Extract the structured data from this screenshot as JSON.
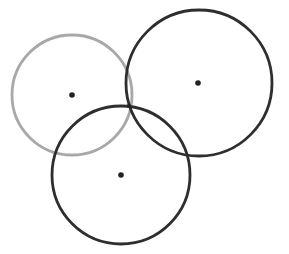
{
  "diagram": {
    "type": "three-circles",
    "background": "#ffffff",
    "circles": [
      {
        "name": "left-circle",
        "cx": 72,
        "cy": 95,
        "r": 60,
        "stroke": "#a8a8a8",
        "stroke_width": 2.8
      },
      {
        "name": "right-circle",
        "cx": 199,
        "cy": 83,
        "r": 73,
        "stroke": "#2e2e2e",
        "stroke_width": 2.8
      },
      {
        "name": "bottom-circle",
        "cx": 121,
        "cy": 175,
        "r": 69,
        "stroke": "#2e2e2e",
        "stroke_width": 2.8
      }
    ],
    "center_points": [
      {
        "name": "left-center",
        "cx": 72,
        "cy": 95,
        "r": 2.8,
        "fill": "#222222"
      },
      {
        "name": "right-center",
        "cx": 198,
        "cy": 83,
        "r": 2.8,
        "fill": "#222222"
      },
      {
        "name": "bottom-center",
        "cx": 121,
        "cy": 175,
        "r": 2.8,
        "fill": "#222222"
      }
    ],
    "intersection_point": {
      "name": "common-intersection",
      "cx": 129,
      "cy": 106,
      "r": 2,
      "fill": "#222222"
    }
  }
}
